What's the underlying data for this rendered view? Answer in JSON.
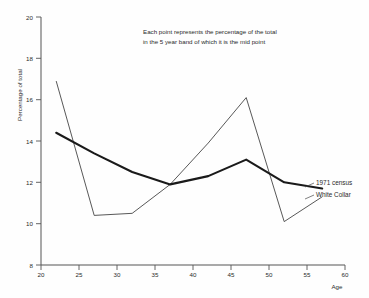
{
  "chart_data": {
    "type": "line",
    "title": "",
    "subtitle": "",
    "xlabel": "Age",
    "ylabel": "Percentage of total",
    "xlim": [
      20,
      60
    ],
    "ylim": [
      8,
      20
    ],
    "grid": false,
    "legend_position": "inline-right",
    "x_ticks": [
      20,
      25,
      30,
      35,
      40,
      45,
      50,
      55,
      60
    ],
    "y_ticks": [
      8,
      10,
      12,
      14,
      16,
      18,
      20
    ],
    "annotation": {
      "line1": "Each point represents the percentage of the total",
      "line2": "in the 5 year band of which it is the mid point"
    },
    "series": [
      {
        "name": "1971 census",
        "style": "thick",
        "color": "#1a1a1a",
        "x": [
          22,
          27,
          32,
          37,
          42,
          47,
          52,
          57
        ],
        "values": [
          14.4,
          13.4,
          12.5,
          11.9,
          12.3,
          13.1,
          12.0,
          11.7
        ]
      },
      {
        "name": "White Collar",
        "style": "thin",
        "color": "#3a3a3a",
        "x": [
          22,
          27,
          32,
          37,
          42,
          47,
          52,
          57
        ],
        "values": [
          16.9,
          10.4,
          10.5,
          11.9,
          13.9,
          16.1,
          10.1,
          11.3
        ]
      }
    ]
  },
  "labels": {
    "y_axis_title": "Percentage of total",
    "x_axis_title": "Age",
    "series_1971": "1971 census",
    "series_white_collar": "White Collar",
    "annotation_line_1": "Each point represents the percentage of the total",
    "annotation_line_2": "in the 5 year band of which it is the mid point"
  }
}
